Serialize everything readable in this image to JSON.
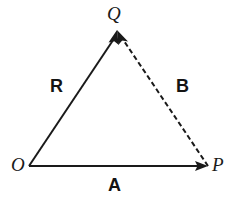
{
  "diagram": {
    "type": "vector-triangle",
    "background_color": "#ffffff",
    "stroke_color": "#1a1a1a",
    "stroke_width": 2,
    "points": {
      "O": {
        "label": "O",
        "x": 29,
        "y": 166
      },
      "P": {
        "label": "P",
        "x": 208,
        "y": 166
      },
      "Q": {
        "label": "Q",
        "x": 117,
        "y": 30
      }
    },
    "vectors": [
      {
        "name": "A",
        "label": "A",
        "from": "O",
        "to": "P",
        "style": "solid",
        "arrowhead": "end",
        "label_x": 117,
        "label_y": 184
      },
      {
        "name": "B",
        "label": "B",
        "from": "P",
        "to": "Q",
        "style": "dashed",
        "arrowhead": "end",
        "label_x": 183,
        "label_y": 86
      },
      {
        "name": "R",
        "label": "R",
        "from": "O",
        "to": "Q",
        "style": "solid",
        "arrowhead": "end",
        "label_x": 57,
        "label_y": 86
      }
    ],
    "dash_pattern": "5 3"
  }
}
